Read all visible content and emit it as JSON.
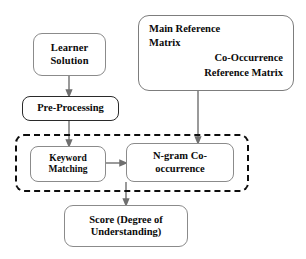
{
  "diagram": {
    "background_color": "#ffffff",
    "text_color": "#0a0a0a",
    "connector_color": "#6f6f6f",
    "dashed_group_color": "#0d0d0d",
    "nodes": {
      "learner_solution": {
        "label": "Learner\nSolution"
      },
      "pre_processing": {
        "label": "Pre-Processing"
      },
      "reference_matrix": {
        "main_label": "Main Reference\n    Matrix",
        "co_occurrence_label": "Co-Occurrence\nReference Matrix"
      },
      "keyword_matching": {
        "label": "Keyword\nMatching"
      },
      "ngram_cooccurrence": {
        "label": "N-gram Co-\noccurrence"
      },
      "score": {
        "label": "Score (Degree of\nUnderstanding)"
      }
    },
    "group": {
      "dashed_region_name": "matching-and-cooccurrence-group"
    },
    "connectors": [
      {
        "name": "learner-to-preprocessing",
        "from": "learner_solution",
        "to": "pre_processing",
        "style": "solid-arrow"
      },
      {
        "name": "preprocessing-to-keyword",
        "from": "pre_processing",
        "to": "keyword_matching",
        "style": "solid-arrow"
      },
      {
        "name": "keyword-to-ngram",
        "from": "keyword_matching",
        "to": "ngram_cooccurrence",
        "style": "solid-arrow"
      },
      {
        "name": "refmatrix-to-ngram",
        "from": "reference_matrix",
        "to": "ngram_cooccurrence",
        "style": "solid-arrow"
      },
      {
        "name": "group-to-score",
        "from": "matching-and-cooccurrence-group",
        "to": "score",
        "style": "solid-arrow"
      }
    ]
  }
}
